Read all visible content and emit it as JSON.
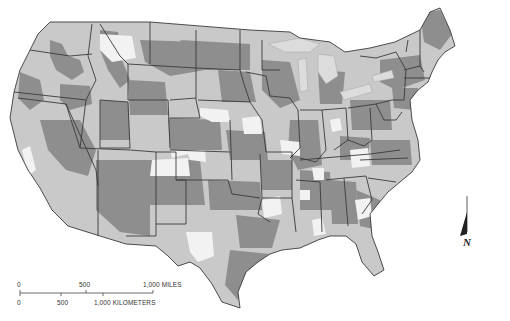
{
  "map": {
    "title": "Contiguous United States choropleth (grayscale)",
    "legend_classes": [
      {
        "name": "low",
        "color": "#f2f2f2"
      },
      {
        "name": "mid",
        "color": "#c9c9c9"
      },
      {
        "name": "high",
        "color": "#8e8e8e"
      }
    ],
    "border_color": "#3a3a3a",
    "water_color": "#ffffff"
  },
  "scale_bar": {
    "miles_labels": [
      "0",
      "500",
      "1,000 MILES"
    ],
    "km_labels": [
      "0",
      "500",
      "1,000 KILOMETERS"
    ]
  },
  "north_arrow": {
    "label": "N"
  }
}
